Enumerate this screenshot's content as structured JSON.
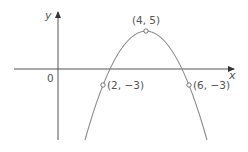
{
  "diagram": {
    "type": "parabola-graph",
    "axes": {
      "x_label": "x",
      "y_label": "y",
      "origin_label": "0"
    },
    "curve": {
      "kind": "downward parabola",
      "color": "#8a8a8a"
    },
    "points": [
      {
        "label": "(4, 5)",
        "role": "vertex"
      },
      {
        "label": "(2, −3)",
        "role": "point-left"
      },
      {
        "label": "(6, −3)",
        "role": "point-right"
      }
    ],
    "colors": {
      "axis": "#555555",
      "curve": "#8a8a8a",
      "text": "#555555"
    }
  }
}
